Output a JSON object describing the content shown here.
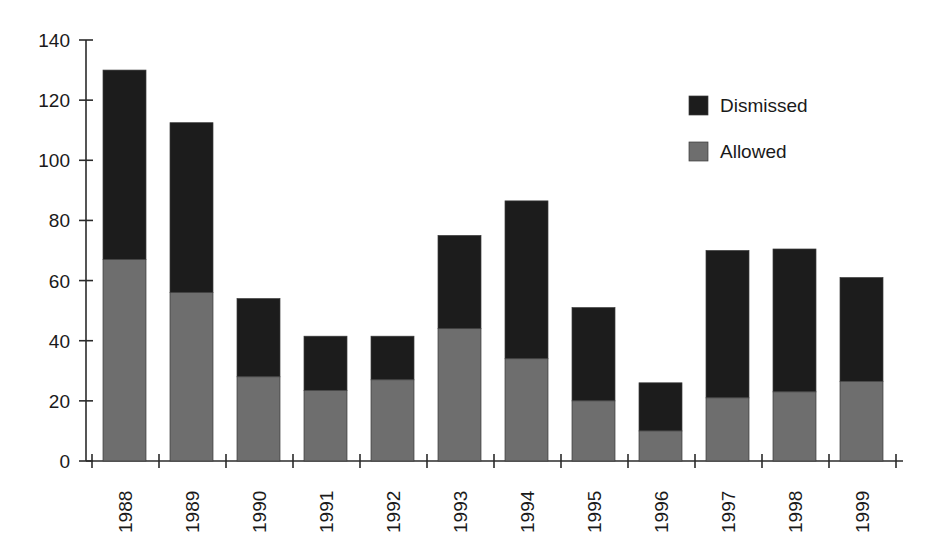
{
  "chart_data": {
    "type": "bar",
    "subtype": "stacked-vertical",
    "title": "",
    "subtitle": "",
    "xlabel": "",
    "ylabel": "",
    "categories": [
      "1988",
      "1989",
      "1990",
      "1991",
      "1992",
      "1993",
      "1994",
      "1995",
      "1996",
      "1997",
      "1998",
      "1999"
    ],
    "series": [
      {
        "name": "Allowed",
        "color": "#6e6e6e",
        "stack_order": 0,
        "values": [
          67,
          56,
          28,
          23.5,
          27,
          44,
          34,
          20,
          10,
          21,
          23,
          26.5
        ]
      },
      {
        "name": "Dismissed",
        "color": "#1c1c1c",
        "stack_order": 1,
        "values": [
          63,
          56.5,
          26,
          18,
          14.5,
          31,
          52.5,
          31,
          16,
          49,
          47.5,
          34.5
        ]
      }
    ],
    "totals": [
      130,
      112.5,
      54,
      41.5,
      41.5,
      75,
      86.5,
      51,
      26,
      70,
      70.5,
      61
    ],
    "ylim": [
      0,
      140
    ],
    "yticks": [
      0,
      20,
      40,
      60,
      80,
      100,
      120,
      140
    ],
    "ytick_labels": [
      "0",
      "20",
      "40",
      "60",
      "80",
      "100",
      "120",
      "140"
    ],
    "grid": false,
    "legend_position": "top-right",
    "legend_entries": [
      {
        "label": "Dismissed",
        "swatch_color": "#1c1c1c",
        "swatch_name": "legend-swatch-dismissed"
      },
      {
        "label": "Allowed",
        "swatch_color": "#6e6e6e",
        "swatch_name": "legend-swatch-allowed"
      }
    ],
    "xtick_label_rotation": -90,
    "axis_color": "#2b2b2b",
    "background_color": "#ffffff"
  }
}
